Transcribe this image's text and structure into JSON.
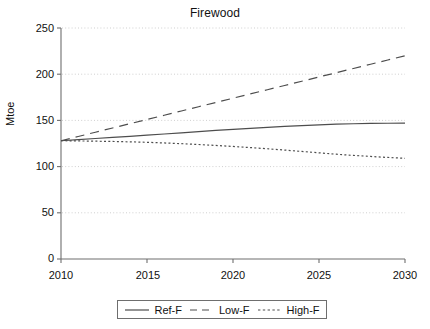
{
  "chart_data": {
    "type": "line",
    "title": "Firewood",
    "xlabel": "",
    "ylabel": "Mtoe",
    "xlim": [
      2010,
      2030
    ],
    "ylim": [
      0,
      250
    ],
    "xticks": [
      2010,
      2015,
      2020,
      2025,
      2030
    ],
    "yticks": [
      0,
      50,
      100,
      150,
      200,
      250
    ],
    "grid": true,
    "grid_style": "dotted-horizontal",
    "legend_position": "bottom-center",
    "x": [
      2010,
      2011,
      2012,
      2013,
      2014,
      2015,
      2016,
      2017,
      2018,
      2019,
      2020,
      2021,
      2022,
      2023,
      2024,
      2025,
      2026,
      2027,
      2028,
      2029,
      2030
    ],
    "series": [
      {
        "name": "Ref-F",
        "style": "solid",
        "color": "#4d4d4d",
        "values": [
          128,
          129.2,
          130.4,
          131.6,
          132.8,
          134,
          135.3,
          136.6,
          137.9,
          139.1,
          140.3,
          141.4,
          142.5,
          143.5,
          144.4,
          145.2,
          145.9,
          146.4,
          146.7,
          146.9,
          147
        ]
      },
      {
        "name": "Low-F",
        "style": "dashed",
        "color": "#4d4d4d",
        "values": [
          128,
          132.6,
          137.2,
          141.8,
          146.4,
          151,
          155.6,
          160.2,
          164.8,
          169.4,
          174,
          178.6,
          183.2,
          187.8,
          192.4,
          197,
          201.6,
          206.2,
          210.8,
          215.4,
          220
        ]
      },
      {
        "name": "High-F",
        "style": "dotted",
        "color": "#4d4d4d",
        "values": [
          128,
          127.8,
          127.5,
          127.2,
          126.8,
          126.3,
          125.6,
          124.8,
          123.9,
          122.9,
          121.8,
          120.6,
          119.3,
          117.9,
          116.4,
          114.9,
          113.4,
          112.1,
          111,
          109.9,
          109
        ]
      }
    ]
  },
  "axis": {
    "ylabel": "Mtoe",
    "ytick_labels": [
      "250",
      "200",
      "150",
      "100",
      "50",
      "0"
    ],
    "xtick_labels": [
      "2010",
      "2015",
      "2020",
      "2025",
      "2030"
    ]
  },
  "legend": {
    "items": [
      {
        "label": "Ref-F",
        "style": "solid"
      },
      {
        "label": "Low-F",
        "style": "dashed"
      },
      {
        "label": "High-F",
        "style": "dotted"
      }
    ]
  },
  "colors": {
    "line": "#4d4d4d",
    "axis": "#6e6e6e",
    "grid": "#cfcfcf",
    "text": "#111111",
    "background": "#ffffff"
  }
}
